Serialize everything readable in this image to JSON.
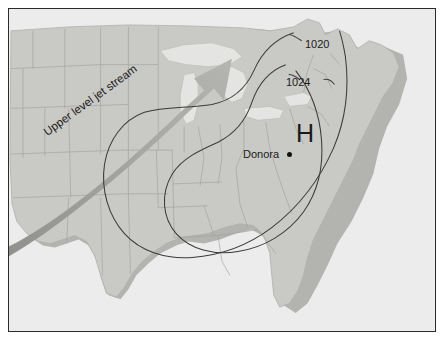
{
  "figure": {
    "kind": "weather-map",
    "region": "Eastern United States"
  },
  "colors": {
    "background": "#ffffff",
    "frame_border": "#2b2b2b",
    "ocean": "#ececec",
    "land": "#c9c9c5",
    "land_shadow": "#a9a9a5",
    "lake": "#e2e2e0",
    "state_border": "#a0a09c",
    "coast_outline": "#b3b3af",
    "isobar": "#3b3b3b",
    "jet_arrow": "#9d9d9a",
    "text": "#1a1a1a",
    "marker_dot": "#111111"
  },
  "map": {
    "isobars": [
      {
        "name": "isobar-1020",
        "label": "1020",
        "value": 1020
      },
      {
        "name": "isobar-1024",
        "label": "1024",
        "value": 1024
      }
    ],
    "pressure_center": {
      "symbol": "H",
      "type": "high-pressure"
    },
    "city": {
      "label": "Donora",
      "marker": "dot"
    },
    "jet_stream": {
      "label": "Upper level jet stream",
      "direction": "southwest-to-northeast",
      "arrow": "arrow-icon"
    }
  }
}
